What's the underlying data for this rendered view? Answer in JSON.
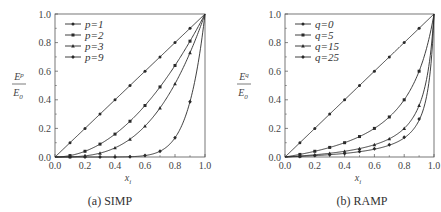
{
  "chart_data": [
    {
      "type": "line",
      "id": "simp",
      "caption": "(a) SIMP",
      "xlabel": "x_i",
      "ylabel": "E^p / E_0",
      "xlim": [
        0.0,
        1.0
      ],
      "ylim": [
        0.0,
        1.0
      ],
      "xticks": [
        "0.0",
        "0.2",
        "0.4",
        "0.6",
        "0.8",
        "1.0"
      ],
      "yticks": [
        "0.0",
        "0.2",
        "0.4",
        "0.6",
        "0.8",
        "1.0"
      ],
      "grid": false,
      "legend_position": "upper left",
      "model": "x^p",
      "x": [
        0.0,
        0.1,
        0.2,
        0.3,
        0.4,
        0.5,
        0.6,
        0.7,
        0.8,
        0.9,
        1.0
      ],
      "series": [
        {
          "name": "p=1",
          "param_label": "p",
          "param_value": 1,
          "values": [
            0.0,
            0.1,
            0.2,
            0.3,
            0.4,
            0.5,
            0.6,
            0.7,
            0.8,
            0.9,
            1.0
          ]
        },
        {
          "name": "p=2",
          "param_label": "p",
          "param_value": 2,
          "values": [
            0.0,
            0.01,
            0.04,
            0.09,
            0.16,
            0.25,
            0.36,
            0.49,
            0.64,
            0.81,
            1.0
          ]
        },
        {
          "name": "p=3",
          "param_label": "p",
          "param_value": 3,
          "values": [
            0.0,
            0.001,
            0.008,
            0.027,
            0.064,
            0.125,
            0.216,
            0.343,
            0.512,
            0.729,
            1.0
          ]
        },
        {
          "name": "p=9",
          "param_label": "p",
          "param_value": 9,
          "values": [
            0.0,
            0.0,
            0.0,
            0.0,
            0.0003,
            0.002,
            0.01,
            0.04,
            0.134,
            0.387,
            1.0
          ]
        }
      ]
    },
    {
      "type": "line",
      "id": "ramp",
      "caption": "(b) RAMP",
      "xlabel": "x_i",
      "ylabel": "E^q / E_0",
      "xlim": [
        0.0,
        1.0
      ],
      "ylim": [
        0.0,
        1.0
      ],
      "xticks": [
        "0.0",
        "0.2",
        "0.4",
        "0.6",
        "0.8",
        "1.0"
      ],
      "yticks": [
        "0.0",
        "0.2",
        "0.4",
        "0.6",
        "0.8",
        "1.0"
      ],
      "grid": false,
      "legend_position": "upper left",
      "model": "x/(1+q(1-x))",
      "x": [
        0.0,
        0.1,
        0.2,
        0.3,
        0.4,
        0.5,
        0.6,
        0.7,
        0.8,
        0.9,
        1.0
      ],
      "series": [
        {
          "name": "q=0",
          "param_label": "q",
          "param_value": 0,
          "values": [
            0.0,
            0.1,
            0.2,
            0.3,
            0.4,
            0.5,
            0.6,
            0.7,
            0.8,
            0.9,
            1.0
          ]
        },
        {
          "name": "q=5",
          "param_label": "q",
          "param_value": 5,
          "values": [
            0.0,
            0.018,
            0.04,
            0.067,
            0.1,
            0.143,
            0.2,
            0.28,
            0.4,
            0.6,
            1.0
          ]
        },
        {
          "name": "q=15",
          "param_label": "q",
          "param_value": 15,
          "values": [
            0.0,
            0.007,
            0.015,
            0.026,
            0.04,
            0.059,
            0.086,
            0.127,
            0.2,
            0.36,
            1.0
          ]
        },
        {
          "name": "q=25",
          "param_label": "q",
          "param_value": 25,
          "values": [
            0.0,
            0.004,
            0.01,
            0.016,
            0.025,
            0.038,
            0.057,
            0.085,
            0.138,
            0.265,
            1.0
          ]
        }
      ]
    }
  ],
  "panels": {
    "a": {
      "caption": "(a) SIMP",
      "y_numer": "E",
      "y_numer_sup": "p",
      "y_denom": "E",
      "y_denom_sub": "0",
      "x_label": "x",
      "x_label_sub": "i"
    },
    "b": {
      "caption": "(b) RAMP",
      "y_numer": "E",
      "y_numer_sup": "q",
      "y_denom": "E",
      "y_denom_sub": "0",
      "x_label": "x",
      "x_label_sub": "i"
    }
  },
  "colors": {
    "line": "#2a2a2a",
    "axis": "#555555",
    "text": "#333333",
    "background": "#ffffff"
  }
}
